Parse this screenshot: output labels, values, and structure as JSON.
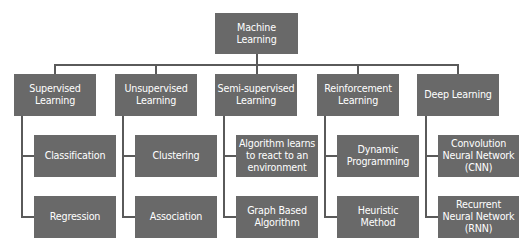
{
  "diagram": {
    "root": {
      "label": "Machine Learning"
    },
    "categories": [
      {
        "label": "Supervised Learning",
        "children": [
          {
            "label": "Classification"
          },
          {
            "label": "Regression"
          }
        ]
      },
      {
        "label": "Unsupervised Learning",
        "children": [
          {
            "label": "Clustering"
          },
          {
            "label": "Association"
          }
        ]
      },
      {
        "label": "Semi-supervised Learning",
        "children": [
          {
            "label": "Algorithm learns to react to an environment"
          },
          {
            "label": "Graph Based Algorithm"
          }
        ]
      },
      {
        "label": "Reinforcement Learning",
        "children": [
          {
            "label": "Dynamic Programming"
          },
          {
            "label": "Heuristic Method"
          }
        ]
      },
      {
        "label": "Deep Learning",
        "children": [
          {
            "label": "Convolution Neural Network (CNN)"
          },
          {
            "label": "Recurrent Neural Network (RNN)"
          }
        ]
      }
    ],
    "colors": {
      "box_fill": "#696969",
      "box_text": "#ffffff",
      "connector": "#5a5a5a",
      "background": "#ffffff"
    }
  }
}
